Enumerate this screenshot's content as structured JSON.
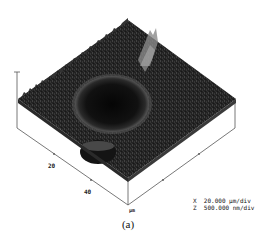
{
  "figure": {
    "type": "afm-3d-surface",
    "caption": "(a)",
    "axis_ticks": [
      "20",
      "40"
    ],
    "axis_unit": "µm",
    "legend": {
      "x_scale": "X  20.000 µm/div",
      "z_scale": "Z  500.000 nm/div"
    },
    "colors": {
      "surface_dark": "#1a1a1a",
      "surface_mid": "#3a3a3a",
      "crater": "#0c0c0c",
      "highlight": "#9a9a9a",
      "axis": "#555555"
    }
  }
}
